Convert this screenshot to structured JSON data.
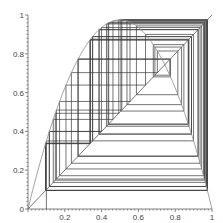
{
  "chart_data": {
    "type": "line",
    "title": "",
    "xlabel": "",
    "ylabel": "",
    "xlim": [
      0,
      1
    ],
    "ylim": [
      0,
      1
    ],
    "grid": false,
    "legend": null,
    "x_ticks": [
      "0",
      "0.2",
      "0.4",
      "0.6",
      "0.8",
      "1"
    ],
    "y_ticks": [
      "0",
      "0.2",
      "0.4",
      "0.6",
      "0.8",
      "1"
    ],
    "map": {
      "formula": "f(x) = r*x*(1-x)",
      "r": 3.9
    },
    "cobweb": {
      "x0": 0.1,
      "iterations": 60
    },
    "series": [
      {
        "name": "logistic-curve",
        "function": "r*x*(1-x)",
        "color": "#888888"
      },
      {
        "name": "identity-line",
        "function": "x",
        "color": "#555555"
      },
      {
        "name": "cobweb-path",
        "color": "#333333"
      }
    ]
  },
  "plot_area": {
    "left": 28,
    "top": 15,
    "right": 212,
    "bottom": 209
  }
}
